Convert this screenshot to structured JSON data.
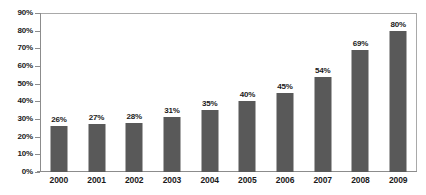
{
  "chart_data": {
    "type": "bar",
    "title": "",
    "subtitle": "",
    "xlabel": "",
    "ylabel": "",
    "categories": [
      "2000",
      "2001",
      "2002",
      "2003",
      "2004",
      "2005",
      "2006",
      "2007",
      "2008",
      "2009"
    ],
    "values": [
      26,
      27,
      28,
      31,
      35,
      40,
      45,
      54,
      69,
      80
    ],
    "value_labels": [
      "26%",
      "27%",
      "28%",
      "31%",
      "35%",
      "40%",
      "45%",
      "54%",
      "69%",
      "80%"
    ],
    "ylim": [
      0,
      90
    ],
    "ytick_values": [
      0,
      10,
      20,
      30,
      40,
      50,
      60,
      70,
      80,
      90
    ],
    "ytick_labels": [
      "0%",
      "10%",
      "20%",
      "30%",
      "40%",
      "50%",
      "60%",
      "70%",
      "80%",
      "90%"
    ],
    "grid": false,
    "legend": "none",
    "series": [
      {
        "name": "",
        "values": [
          26,
          27,
          28,
          31,
          35,
          40,
          45,
          54,
          69,
          80
        ]
      }
    ],
    "colors": {
      "bar": "#595959",
      "background": "#ffffff",
      "axis": "#8c8c8c",
      "frame": "#a9a9a9",
      "text": "#1a1a1a"
    }
  }
}
